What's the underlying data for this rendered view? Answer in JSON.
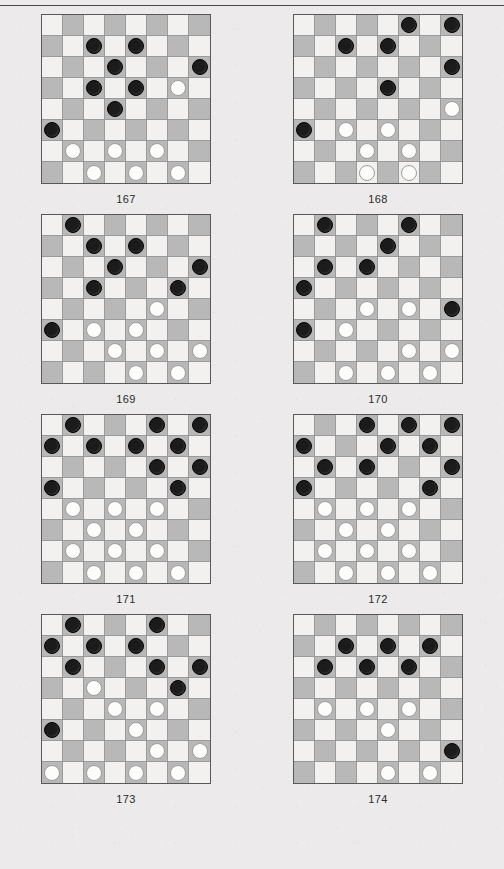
{
  "page": {
    "background_color": "#eceaea",
    "rule_color": "#4a4a4a"
  },
  "board_style": {
    "light_square_color": "#f3f1ef",
    "dark_square_color": "#b8b8b8",
    "black_piece_color": "#1b1b1b",
    "white_piece_color": "#fcfcfa",
    "grid_line_color": "#9a9a9a",
    "border_color": "#585858",
    "rows": 8,
    "cols": 8,
    "dark_square_parity": "odd"
  },
  "legend": {
    "black_piece": "black-checker",
    "white_piece": "white-checker",
    "empty": "empty-square"
  },
  "boards": [
    {
      "label": "167",
      "grid": [
        [
          "",
          "",
          "",
          "",
          "",
          "",
          "",
          ""
        ],
        [
          "",
          "",
          "b",
          "",
          "b",
          "",
          "",
          ""
        ],
        [
          "",
          "",
          "",
          "b",
          "",
          "",
          "",
          "b"
        ],
        [
          "",
          "",
          "b",
          "",
          "b",
          "",
          "w",
          ""
        ],
        [
          "",
          "",
          "",
          "b",
          "",
          "",
          "",
          ""
        ],
        [
          "b",
          "",
          "",
          "",
          "",
          "",
          "",
          ""
        ],
        [
          "",
          "w",
          "",
          "w",
          "",
          "w",
          "",
          ""
        ],
        [
          "",
          "",
          "w",
          "",
          "w",
          "",
          "w",
          ""
        ]
      ]
    },
    {
      "label": "168",
      "grid": [
        [
          "",
          "",
          "",
          "",
          "",
          "b",
          "",
          "b"
        ],
        [
          "",
          "",
          "b",
          "",
          "b",
          "",
          "",
          ""
        ],
        [
          "",
          "",
          "",
          "",
          "",
          "",
          "",
          "b"
        ],
        [
          "",
          "",
          "",
          "",
          "b",
          "",
          "",
          ""
        ],
        [
          "",
          "",
          "",
          "",
          "",
          "",
          "",
          "w"
        ],
        [
          "b",
          "",
          "w",
          "",
          "w",
          "",
          "",
          ""
        ],
        [
          "",
          "",
          "",
          "w",
          "",
          "w",
          "",
          ""
        ],
        [
          "",
          "",
          "",
          "w",
          "",
          "w",
          "",
          ""
        ]
      ]
    },
    {
      "label": "169",
      "grid": [
        [
          "",
          "b",
          "",
          "",
          "",
          "",
          "",
          ""
        ],
        [
          "",
          "",
          "b",
          "",
          "b",
          "",
          "",
          ""
        ],
        [
          "",
          "",
          "",
          "b",
          "",
          "",
          "",
          "b"
        ],
        [
          "",
          "",
          "b",
          "",
          "",
          "",
          "b",
          ""
        ],
        [
          "",
          "",
          "",
          "",
          "",
          "w",
          "",
          ""
        ],
        [
          "b",
          "",
          "w",
          "",
          "w",
          "",
          "",
          ""
        ],
        [
          "",
          "",
          "",
          "w",
          "",
          "w",
          "",
          "w"
        ],
        [
          "",
          "",
          "",
          "",
          "w",
          "",
          "w",
          ""
        ]
      ]
    },
    {
      "label": "170",
      "grid": [
        [
          "",
          "b",
          "",
          "",
          "",
          "b",
          "",
          ""
        ],
        [
          "",
          "",
          "",
          "",
          "b",
          "",
          "",
          ""
        ],
        [
          "",
          "b",
          "",
          "b",
          "",
          "",
          "",
          ""
        ],
        [
          "b",
          "",
          "",
          "",
          "",
          "",
          "",
          ""
        ],
        [
          "",
          "",
          "",
          "w",
          "",
          "w",
          "",
          "b"
        ],
        [
          "b",
          "",
          "w",
          "",
          "",
          "",
          "",
          ""
        ],
        [
          "",
          "",
          "",
          "",
          "",
          "w",
          "",
          "w"
        ],
        [
          "",
          "",
          "w",
          "",
          "w",
          "",
          "w",
          ""
        ]
      ]
    },
    {
      "label": "171",
      "grid": [
        [
          "",
          "b",
          "",
          "",
          "",
          "b",
          "",
          "b"
        ],
        [
          "b",
          "",
          "b",
          "",
          "b",
          "",
          "b",
          ""
        ],
        [
          "",
          "",
          "",
          "",
          "",
          "b",
          "",
          "b"
        ],
        [
          "b",
          "",
          "",
          "",
          "",
          "",
          "b",
          ""
        ],
        [
          "",
          "w",
          "",
          "w",
          "",
          "w",
          "",
          ""
        ],
        [
          "",
          "",
          "w",
          "",
          "w",
          "",
          "",
          ""
        ],
        [
          "",
          "w",
          "",
          "w",
          "",
          "w",
          "",
          ""
        ],
        [
          "",
          "",
          "w",
          "",
          "w",
          "",
          "w",
          ""
        ]
      ]
    },
    {
      "label": "172",
      "grid": [
        [
          "",
          "",
          "",
          "b",
          "",
          "b",
          "",
          "b"
        ],
        [
          "b",
          "",
          "",
          "",
          "b",
          "",
          "b",
          ""
        ],
        [
          "",
          "b",
          "",
          "b",
          "",
          "",
          "",
          "b"
        ],
        [
          "b",
          "",
          "",
          "",
          "",
          "",
          "b",
          ""
        ],
        [
          "",
          "w",
          "",
          "w",
          "",
          "w",
          "",
          ""
        ],
        [
          "",
          "",
          "w",
          "",
          "w",
          "",
          "",
          ""
        ],
        [
          "",
          "w",
          "",
          "w",
          "",
          "w",
          "",
          ""
        ],
        [
          "",
          "",
          "w",
          "",
          "w",
          "",
          "w",
          ""
        ]
      ]
    },
    {
      "label": "173",
      "grid": [
        [
          "",
          "b",
          "",
          "",
          "",
          "b",
          "",
          ""
        ],
        [
          "b",
          "",
          "b",
          "",
          "b",
          "",
          "",
          ""
        ],
        [
          "",
          "b",
          "",
          "",
          "",
          "b",
          "",
          "b"
        ],
        [
          "",
          "",
          "w",
          "",
          "",
          "",
          "b",
          ""
        ],
        [
          "",
          "",
          "",
          "w",
          "",
          "w",
          "",
          ""
        ],
        [
          "b",
          "",
          "",
          "",
          "w",
          "",
          "",
          ""
        ],
        [
          "",
          "",
          "",
          "",
          "",
          "w",
          "",
          "w"
        ],
        [
          "w",
          "",
          "w",
          "",
          "w",
          "",
          "w",
          ""
        ]
      ]
    },
    {
      "label": "174",
      "grid": [
        [
          "",
          "",
          "",
          "",
          "",
          "",
          "",
          ""
        ],
        [
          "",
          "",
          "b",
          "",
          "b",
          "",
          "b",
          ""
        ],
        [
          "",
          "b",
          "",
          "b",
          "",
          "b",
          "",
          ""
        ],
        [
          "",
          "",
          "",
          "",
          "",
          "",
          "",
          ""
        ],
        [
          "",
          "w",
          "",
          "w",
          "",
          "w",
          "",
          ""
        ],
        [
          "",
          "",
          "",
          "",
          "w",
          "",
          "",
          ""
        ],
        [
          "",
          "",
          "",
          "",
          "",
          "",
          "",
          "b"
        ],
        [
          "",
          "",
          "",
          "",
          "w",
          "",
          "w",
          ""
        ]
      ]
    }
  ]
}
